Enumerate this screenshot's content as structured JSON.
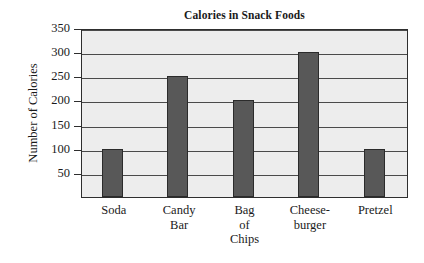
{
  "chart_data": {
    "type": "bar",
    "title": "Calories in Snack Foods",
    "xlabel": "",
    "ylabel": "Number of Calories",
    "categories": [
      "Soda",
      "Candy\nBar",
      "Bag\nof\nChips",
      "Cheese-\nburger",
      "Pretzel"
    ],
    "values": [
      100,
      250,
      200,
      300,
      100
    ],
    "ylim": [
      0,
      350
    ],
    "yticks": [
      50,
      100,
      150,
      200,
      250,
      300,
      350
    ],
    "ytick_labels": [
      "50",
      "100",
      "150",
      "200",
      "250",
      "300",
      "350"
    ],
    "grid": true,
    "legend": false,
    "bar_color": "#585858",
    "plot_background": "#ededed",
    "axis_color": "#2e2e2e"
  }
}
